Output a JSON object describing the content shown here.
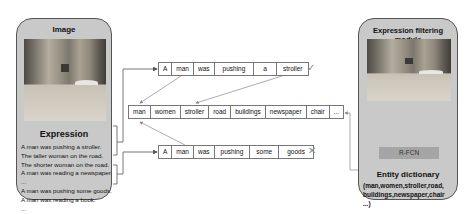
{
  "left_panel": {
    "title": "Image",
    "expression_title": "Expression",
    "expressions": [
      "A man was pushing a stroller.",
      "The taller woman on the road.",
      "The shorter woman on the road.",
      "A man was reading a newspaper.",
      "...",
      "A man was pushing some goods.",
      "A man was reading a book.",
      "..."
    ]
  },
  "sequences": {
    "top": {
      "tokens": [
        "A",
        "man",
        "was",
        "pushing",
        "a",
        "stroller"
      ],
      "result": "✓",
      "result_meaning": "accepted"
    },
    "dictionary": {
      "tokens": [
        "man",
        "women",
        "stroller",
        "road",
        "buildings",
        "newspaper",
        "chair",
        "..."
      ]
    },
    "bottom": {
      "tokens": [
        "A",
        "man",
        "was",
        "pushing",
        "some",
        "goods"
      ],
      "result": "✕",
      "result_meaning": "rejected"
    }
  },
  "right_panel": {
    "title": "Expression filtering module",
    "detector_label": "R-FCN",
    "dictionary_title": "Entity dictionary",
    "dictionary_lines": [
      "(man,women,stroller,road,",
      "buildings,newspaper,chair",
      "...)"
    ]
  },
  "colors": {
    "panel_fill": "#c9c9c9",
    "panel_border": "#555555",
    "rfcn_fill": "#a5a5a5",
    "arrow": "#666666",
    "mark": "#888888"
  }
}
